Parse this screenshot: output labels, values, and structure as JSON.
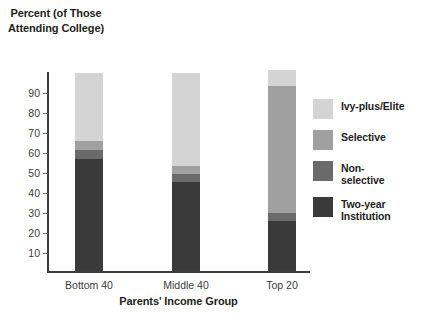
{
  "chart_data": {
    "type": "bar",
    "subtype": "stacked-bar",
    "title": "",
    "ylabel": "Percent (of Those Attending College)",
    "xlabel": "Parents' Income Group",
    "categories": [
      "Bottom 40",
      "Middle 40",
      "Top 20"
    ],
    "ylim": [
      0,
      100
    ],
    "yticks": [
      10,
      20,
      30,
      40,
      50,
      60,
      70,
      80,
      90
    ],
    "grid": false,
    "legend_position": "right",
    "series": [
      {
        "name": "Two-year Institution",
        "color": "#3a3a3a",
        "values": [
          56,
          44.5,
          25
        ]
      },
      {
        "name": "Non-selective",
        "color": "#6a6a6a",
        "values": [
          4.5,
          4,
          4
        ]
      },
      {
        "name": "Selective",
        "color": "#a0a0a0",
        "values": [
          4.5,
          4,
          63.5
        ]
      },
      {
        "name": "Ivy-plus/Elite",
        "color": "#d4d4d4",
        "values": [
          34,
          46.5,
          8
        ]
      }
    ],
    "totals": [
      99,
      99,
      100.5
    ]
  },
  "axis": {
    "y_title": "Percent (of\nThose\nAttending\nCollege)",
    "x_title": "Parents' Income Group",
    "tick_labels": [
      "90",
      "80",
      "70",
      "60",
      "50",
      "40",
      "30",
      "20",
      "10"
    ]
  },
  "legend": {
    "items": [
      {
        "label": "Ivy-plus/Elite",
        "color": "#d4d4d4"
      },
      {
        "label": "Selective",
        "color": "#a0a0a0"
      },
      {
        "label": "Non-\nselective",
        "color": "#6a6a6a"
      },
      {
        "label": "Two-year\nInstitution",
        "color": "#3a3a3a"
      }
    ]
  }
}
